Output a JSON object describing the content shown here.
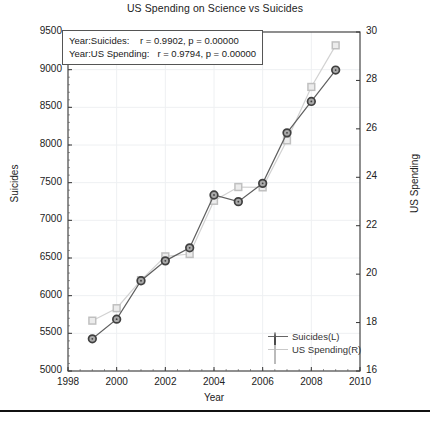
{
  "chart_data": {
    "type": "line",
    "title": "US Spending on Science vs Suicides",
    "xlabel": "Year",
    "ylabel": "Suicides",
    "ylabel_right": "US Spending",
    "xlim": [
      1998,
      2010
    ],
    "ylim": [
      5000,
      9500
    ],
    "ylim_right": [
      16,
      30
    ],
    "grid": true,
    "legend_position": "lower right",
    "xticks": [
      1998,
      2000,
      2002,
      2004,
      2006,
      2008,
      2010
    ],
    "yticks_left": [
      5000,
      5500,
      6000,
      6500,
      7000,
      7500,
      8000,
      8500,
      9000,
      9500
    ],
    "yticks_right": [
      16,
      18,
      20,
      22,
      24,
      26,
      28,
      30
    ],
    "x": [
      1999,
      2000,
      2001,
      2002,
      2003,
      2004,
      2005,
      2006,
      2007,
      2008,
      2009
    ],
    "series": [
      {
        "name": "Suicides(L)",
        "axis": "left",
        "marker": "circle",
        "color": "#5a5a5a",
        "values": [
          5427,
          5688,
          6198,
          6462,
          6635,
          7336,
          7248,
          7491,
          8161,
          8578,
          8995
        ]
      },
      {
        "name": "US Spending(R)",
        "axis": "right",
        "marker": "square",
        "color": "#cccccc",
        "values": [
          18.079,
          18.594,
          19.753,
          20.734,
          20.831,
          23.029,
          23.597,
          23.584,
          25.525,
          27.731,
          29.449
        ]
      }
    ],
    "annotations": [
      "Year:Suicides:    r = 0.9902, p = 0.00000",
      "Year:US Spending:   r = 0.9794, p = 0.00000"
    ],
    "legend": [
      {
        "label": "Suicides(L)",
        "marker": "circle-marker"
      },
      {
        "label": "US Spending(R)",
        "marker": "square-marker"
      }
    ]
  }
}
